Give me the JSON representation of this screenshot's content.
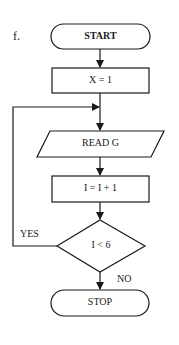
{
  "figure_label": "f.",
  "colors": {
    "stroke": "#1a1a1a",
    "background": "#ffffff"
  },
  "nodes": {
    "start": {
      "type": "terminal",
      "label": "START"
    },
    "init": {
      "type": "process",
      "label": "X = 1"
    },
    "read": {
      "type": "input-output",
      "label": "READ G"
    },
    "increment": {
      "type": "process",
      "label": "I = I + 1"
    },
    "decision": {
      "type": "decision",
      "label": "I < 6"
    },
    "stop": {
      "type": "terminal",
      "label": "STOP"
    }
  },
  "edges": {
    "yes_label": "YES",
    "no_label": "NO"
  }
}
